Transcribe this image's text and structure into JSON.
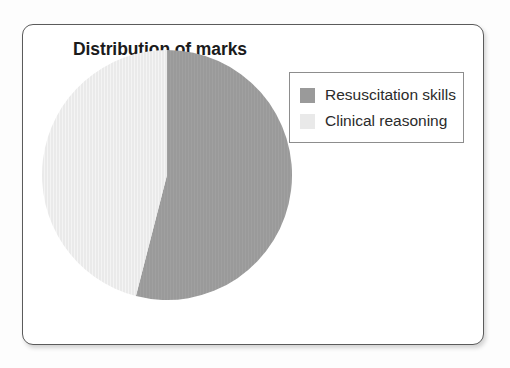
{
  "figure": {
    "title": "Distribution of marks",
    "background_color": "#ffffff",
    "border_color": "#5b5b5b"
  },
  "legend": {
    "position": "top-right",
    "border_color": "#8d8d8d",
    "entries": [
      {
        "label": "Resuscitation skills",
        "color": "#9a9a9a",
        "swatch_name": "legend-swatch-resuscitation-skills"
      },
      {
        "label": "Clinical reasoning",
        "color": "#e9e9e9",
        "swatch_name": "legend-swatch-clinical-reasoning"
      }
    ]
  },
  "chart_data": {
    "type": "pie",
    "title": "Distribution of marks",
    "xlabel": "",
    "ylabel": "",
    "start_angle_deg": 0,
    "direction": "clockwise",
    "grid": false,
    "legend_position": "top-right",
    "labels": [
      "Resuscitation skills",
      "Clinical reasoning"
    ],
    "values": [
      54,
      46
    ],
    "value_unit": "percent",
    "colors": [
      "#9a9a9a",
      "#e9e9e9"
    ],
    "slices": [
      {
        "label": "Resuscitation skills",
        "value": 54,
        "color": "#9a9a9a",
        "start_angle_deg": 0,
        "end_angle_deg": 194.4
      },
      {
        "label": "Clinical reasoning",
        "value": 46,
        "color": "#e9e9e9",
        "start_angle_deg": 194.4,
        "end_angle_deg": 360
      }
    ]
  }
}
